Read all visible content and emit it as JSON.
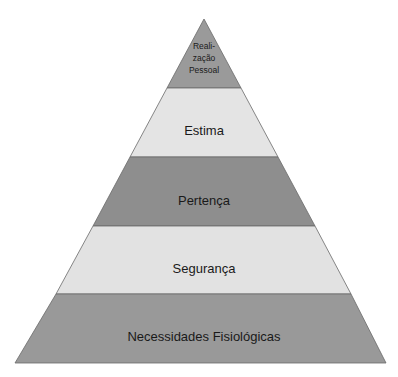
{
  "diagram": {
    "type": "pyramid",
    "levels": [
      {
        "label_lines": [
          "Reali-",
          "zação",
          "Pessoal"
        ],
        "fill": "#9a9a9a"
      },
      {
        "label": "Estima",
        "fill": "#e4e4e4"
      },
      {
        "label": "Pertença",
        "fill": "#8e8e8e"
      },
      {
        "label": "Segurança",
        "fill": "#e2e2e2"
      },
      {
        "label": "Necessidades Fisiológicas",
        "fill": "#999999"
      }
    ]
  }
}
